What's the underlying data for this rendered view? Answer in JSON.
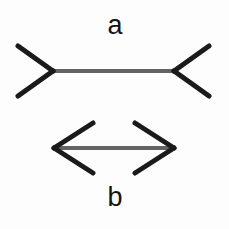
{
  "figure": {
    "background_color": "#fdfdfd",
    "shaft_color": "#636363",
    "fin_color": "#1a1a1a",
    "shaft_width": 4,
    "fin_width": 5,
    "labels": {
      "top": "a",
      "bottom": "b"
    }
  },
  "chart_data": {
    "type": "diagram",
    "xlabel": "",
    "ylabel": "",
    "canvas": {
      "width": 229,
      "height": 229
    },
    "figures": [
      {
        "name": "a",
        "label": "a",
        "label_position": "above",
        "label_x": 115,
        "label_y": 26,
        "fin_direction": "outward",
        "description": "Horizontal shaft with outward-pointing fins (arrow tails) at both ends",
        "shaft": {
          "x1": 53,
          "y1": 71,
          "x2": 174,
          "y2": 71,
          "length": 121
        },
        "fins": [
          {
            "x1": 53,
            "y1": 71,
            "x2": 18,
            "y2": 46
          },
          {
            "x1": 53,
            "y1": 71,
            "x2": 18,
            "y2": 96
          },
          {
            "x1": 174,
            "y1": 71,
            "x2": 209,
            "y2": 46
          },
          {
            "x1": 174,
            "y1": 71,
            "x2": 209,
            "y2": 96
          }
        ]
      },
      {
        "name": "b",
        "label": "b",
        "label_position": "below",
        "label_x": 115,
        "label_y": 198,
        "fin_direction": "inward",
        "description": "Horizontal shaft with inward-pointing fins (arrow heads) at both ends",
        "shaft": {
          "x1": 54,
          "y1": 148,
          "x2": 174,
          "y2": 148,
          "length": 120
        },
        "fins": [
          {
            "x1": 54,
            "y1": 148,
            "x2": 93,
            "y2": 123
          },
          {
            "x1": 54,
            "y1": 148,
            "x2": 93,
            "y2": 173
          },
          {
            "x1": 174,
            "y1": 148,
            "x2": 135,
            "y2": 123
          },
          {
            "x1": 174,
            "y1": 148,
            "x2": 135,
            "y2": 173
          }
        ]
      }
    ],
    "annotations": [
      "Both shafts are equal in length",
      "Figure a appears shorter than figure b"
    ]
  }
}
